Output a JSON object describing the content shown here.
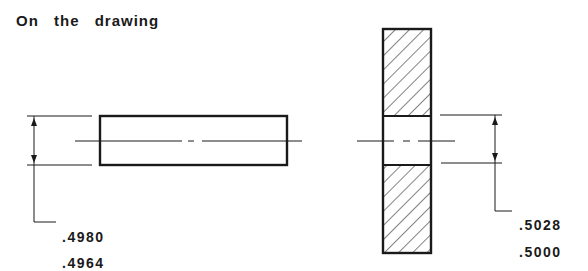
{
  "title": "On the drawing",
  "shaft": {
    "label": "shaft-side-view",
    "tolerance_upper": ".4980",
    "tolerance_lower": ".4964"
  },
  "hole": {
    "label": "hole-section-view",
    "tolerance_upper": ".5028",
    "tolerance_lower": ".5000"
  },
  "colors": {
    "line": "#1a1a1a",
    "background": "#ffffff"
  }
}
